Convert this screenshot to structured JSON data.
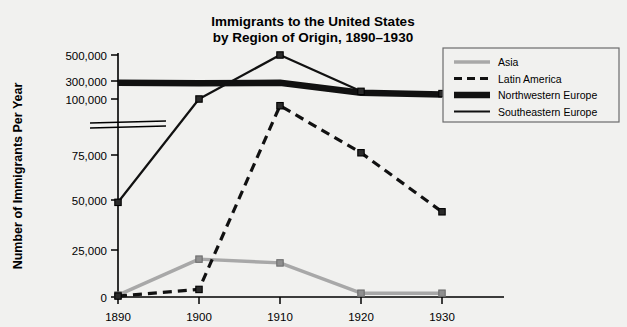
{
  "chart_data": {
    "type": "line",
    "title_line1": "Immigrants to the United States",
    "title_line2": "by Region of Origin, 1890–1930",
    "xlabel": "",
    "ylabel": "Number of Immigrants Per Year",
    "categories": [
      "1890",
      "1900",
      "1910",
      "1920",
      "1930"
    ],
    "x": [
      1890,
      1900,
      1910,
      1920,
      1930
    ],
    "xtick_labels": [
      "1890",
      "1900",
      "1910",
      "1920",
      "1930"
    ],
    "ytick_labels": [
      "0",
      "25,000",
      "50,000",
      "75,000",
      "100,000",
      "300,000",
      "500,000"
    ],
    "ytick_values": [
      0,
      25000,
      50000,
      75000,
      100000,
      300000,
      500000
    ],
    "ylim": [
      0,
      500000
    ],
    "axis_break": {
      "between": [
        75000,
        100000
      ],
      "style": "double-parallel-lines"
    },
    "grid": false,
    "legend_position": "top-right",
    "series": [
      {
        "name": "Asia",
        "values": [
          1000,
          20000,
          18000,
          2000,
          2000
        ],
        "color": "#a8a8a8",
        "style": "solid",
        "width": 3.4,
        "marker": "square"
      },
      {
        "name": "Latin America",
        "values": [
          500,
          4000,
          97000,
          76000,
          45000
        ],
        "color": "#111111",
        "style": "dashed",
        "width": 3.2,
        "marker": "square"
      },
      {
        "name": "Northwestern Europe",
        "values": [
          280000,
          275000,
          280000,
          170000,
          150000
        ],
        "color": "#111111",
        "style": "solid",
        "width": 6.5,
        "marker": "none"
      },
      {
        "name": "Southeastern Europe",
        "values": [
          50000,
          100000,
          500000,
          185000,
          160000
        ],
        "color": "#111111",
        "style": "solid",
        "width": 2.2,
        "marker": "square"
      }
    ]
  },
  "legend": {
    "items": [
      {
        "label": "Asia"
      },
      {
        "label": "Latin America"
      },
      {
        "label": "Northwestern Europe"
      },
      {
        "label": "Southeastern Europe"
      }
    ]
  }
}
